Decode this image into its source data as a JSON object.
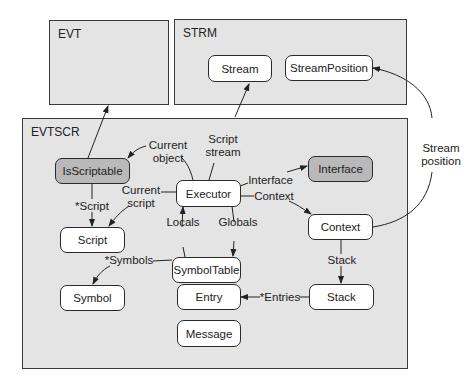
{
  "packages": {
    "evt": "EVT",
    "strm": "STRM",
    "evtscr": "EVTSCR"
  },
  "nodes": {
    "stream": "Stream",
    "stream_position": "StreamPosition",
    "is_scriptable": "IsScriptable",
    "executor": "Executor",
    "interface": "Interface",
    "context": "Context",
    "script": "Script",
    "symbol_table": "SymbolTable",
    "symbol": "Symbol",
    "entry": "Entry",
    "stack": "Stack",
    "message": "Message"
  },
  "edge_labels": {
    "current_object_1": "Current",
    "current_object_2": "object",
    "script_stream_1": "Script",
    "script_stream_2": "stream",
    "current_script_1": "Current",
    "current_script_2": "script",
    "script": "*Script",
    "interface": "Interface",
    "context": "Context",
    "locals": "Locals",
    "globals": "Globals",
    "symbols": "*Symbols",
    "stack": "Stack",
    "entries": "*Entries",
    "stream_position_1": "Stream",
    "stream_position_2": "position"
  },
  "colors": {
    "package_fill": "#e4e4e4",
    "node_fill": "#ffffff",
    "highlight_node_fill": "#b9b9b9",
    "stroke": "#2a2a2a"
  }
}
